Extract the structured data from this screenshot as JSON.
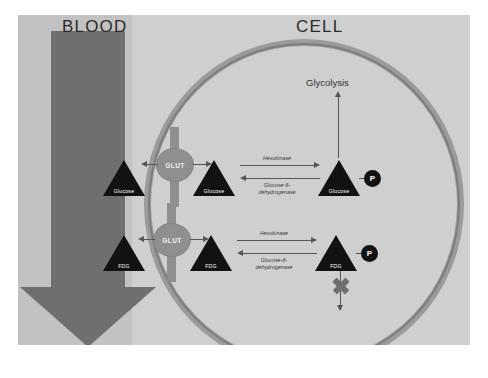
{
  "scan": {
    "top_cut_text": "",
    "bottom_cut_text": ""
  },
  "figure": {
    "regions": {
      "blood_label": "BLOOD",
      "cell_label": "CELL"
    },
    "colors": {
      "background": "#cfcfcf",
      "blood_band": "#c2c2c2",
      "blood_arrow": "#6f6f6f",
      "membrane": "#9b9b9b",
      "molecule": "#121212",
      "transporter": "#8f8f8f",
      "arrow": "#555555",
      "block_mark": "#6f6f6f"
    },
    "glycolysis_label": "Glycolysis",
    "transporters": [
      {
        "label": "GLUT"
      },
      {
        "label": "GLUT"
      }
    ],
    "pathways": [
      {
        "name": "glucose-pathway",
        "blood_molecule": "Glucose",
        "cytosol_molecule": "Glucose",
        "phosphorylated_molecule": "Glucose",
        "phosphate_label": "P",
        "forward_enzyme": "Hexokinase",
        "reverse_enzyme": "Glucose-6-\ndehydrogenase",
        "downstream": "Glycolysis",
        "blocked": false
      },
      {
        "name": "fdg-pathway",
        "blood_molecule": "FDG",
        "cytosol_molecule": "FDG",
        "phosphorylated_molecule": "FDG",
        "phosphate_label": "P",
        "forward_enzyme": "Hexokinase",
        "reverse_enzyme": "Glucose-6-\ndehydrogenase",
        "downstream": "",
        "blocked": true
      }
    ]
  }
}
